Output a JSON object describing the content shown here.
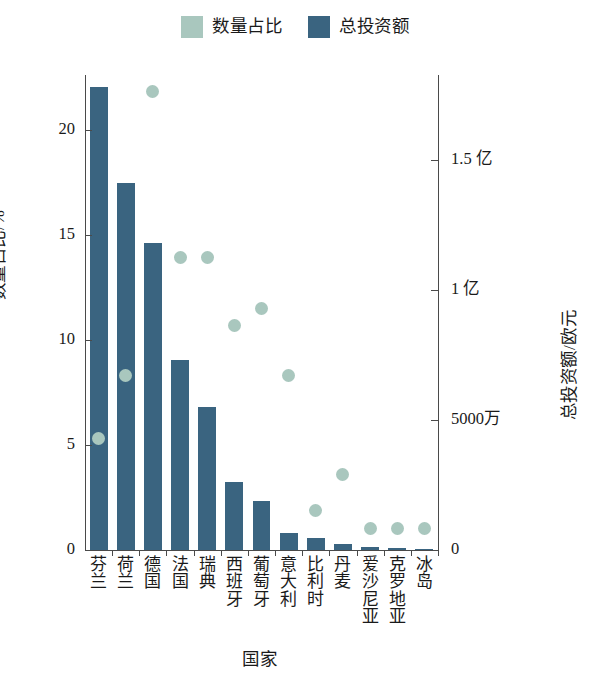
{
  "legend": {
    "position": "top-center",
    "entries": [
      {
        "label": "数量占比",
        "color": "#a9c7be",
        "marker": "square"
      },
      {
        "label": "总投资额",
        "color": "#3a6480",
        "marker": "square"
      }
    ]
  },
  "axes": {
    "x": {
      "title": "国家"
    },
    "y_left": {
      "title": "数量占比/%",
      "ticks": [
        "0",
        "5",
        "10",
        "15",
        "20"
      ],
      "min": 0,
      "max": 22.6
    },
    "y_right": {
      "title": "总投资额/欧元",
      "ticks": [
        "0",
        "5000万",
        "1 亿",
        "1.5 亿"
      ],
      "min": 0,
      "max": 1.827
    }
  },
  "chart_data": {
    "type": "bar",
    "title": "",
    "xlabel": "国家",
    "ylabel": "数量占比/%",
    "ylabel_secondary": "总投资额/欧元",
    "grid": false,
    "legend_position": "top-center",
    "categories": [
      "芬兰",
      "荷兰",
      "德国",
      "法国",
      "瑞典",
      "西班牙",
      "葡萄牙",
      "意大利",
      "比利时",
      "丹麦",
      "爱沙尼亚",
      "克罗地亚",
      "冰岛"
    ],
    "ylim": [
      0,
      22.6
    ],
    "ylim_secondary": [
      0,
      1.827
    ],
    "y_tick_values": [
      0,
      5,
      10,
      15,
      20
    ],
    "y_tick_labels": [
      "0",
      "5",
      "10",
      "15",
      "20"
    ],
    "y2_tick_values": [
      0,
      0.5,
      1.0,
      1.5
    ],
    "y2_tick_labels": [
      "0",
      "5000万",
      "1 亿",
      "1.5 亿"
    ],
    "series": [
      {
        "name": "总投资额",
        "type": "bar",
        "axis": "right",
        "unit": "亿欧元",
        "color": "#3a6480",
        "values": [
          1.78,
          1.41,
          1.18,
          0.73,
          0.55,
          0.26,
          0.19,
          0.065,
          0.045,
          0.022,
          0.012,
          0.008,
          0.004
        ]
      },
      {
        "name": "数量占比",
        "type": "scatter",
        "axis": "left",
        "unit": "%",
        "color": "#a9c7be",
        "values": [
          5.3,
          8.3,
          21.8,
          13.9,
          13.9,
          10.7,
          11.5,
          8.3,
          1.9,
          3.6,
          1.0,
          1.0,
          1.0
        ]
      }
    ]
  }
}
